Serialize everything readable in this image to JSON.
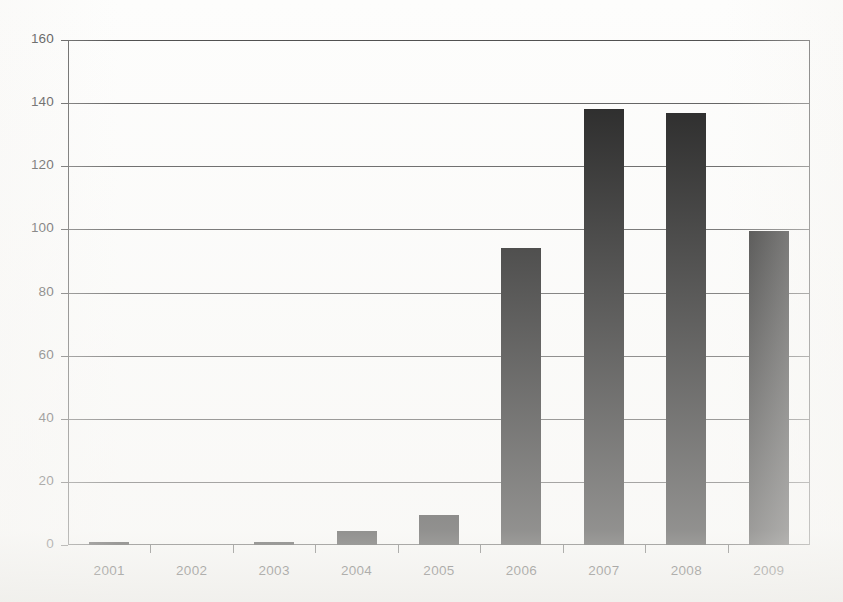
{
  "chart_data": {
    "type": "bar",
    "title": "",
    "subtitle": "",
    "xlabel": "",
    "ylabel": "",
    "categories": [
      "2001",
      "2002",
      "2003",
      "2004",
      "2005",
      "2006",
      "2007",
      "2008",
      "2009"
    ],
    "values": [
      1,
      0,
      1,
      4.5,
      9.5,
      94,
      138,
      137,
      99.5
    ],
    "series": [
      {
        "name": "",
        "values": [
          1,
          0,
          1,
          4.5,
          9.5,
          94,
          138,
          137,
          99.5
        ]
      }
    ],
    "ylim": [
      0,
      160
    ],
    "xlim_categories": 9,
    "y_ticks": [
      0,
      20,
      40,
      60,
      80,
      100,
      120,
      140,
      160
    ],
    "y_tick_labels": [
      "0",
      "20",
      "40",
      "60",
      "80",
      "100",
      "120",
      "140",
      "160"
    ],
    "x_tick_labels": [
      "2001",
      "2002",
      "2003",
      "2004",
      "2005",
      "2006",
      "2007",
      "2008",
      "2009"
    ],
    "grid": true,
    "grid_axis": "y",
    "legend": false,
    "legend_position": "none",
    "bar_color": "#161616",
    "plot_background": "#fdfdfc",
    "axis_color": "#3f3f3f",
    "grid_color": "#555555"
  },
  "figure": {
    "background_color": "#ffffff",
    "width": 843,
    "height": 602
  }
}
